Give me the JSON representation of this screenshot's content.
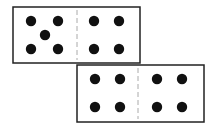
{
  "figure": {
    "colors": {
      "border": "#222222",
      "dot": "#111111",
      "divider": "#aaaaaa",
      "background": "#ffffff"
    },
    "dominoes": [
      {
        "id": "domino-1",
        "x": 13,
        "y": 7,
        "w": 127,
        "h": 56,
        "divider_x": 77,
        "left_count": 5,
        "right_count": 4,
        "dots": [
          [
            31,
            21
          ],
          [
            58,
            21
          ],
          [
            45,
            35
          ],
          [
            31,
            49
          ],
          [
            58,
            49
          ],
          [
            94,
            21
          ],
          [
            119,
            21
          ],
          [
            94,
            49
          ],
          [
            119,
            49
          ]
        ]
      },
      {
        "id": "domino-2",
        "x": 77,
        "y": 65,
        "w": 127,
        "h": 57,
        "divider_x": 138,
        "left_count": 4,
        "right_count": 4,
        "dots": [
          [
            95,
            79
          ],
          [
            120,
            79
          ],
          [
            95,
            107
          ],
          [
            120,
            107
          ],
          [
            157,
            79
          ],
          [
            182,
            79
          ],
          [
            157,
            107
          ],
          [
            182,
            107
          ]
        ]
      }
    ]
  }
}
